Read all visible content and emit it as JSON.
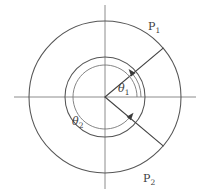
{
  "figure": {
    "type": "geometry-diagram",
    "background_color": "#ffffff"
  },
  "colors": {
    "axis": "#8c8c8c",
    "circle": "#555555",
    "radius": "#444444",
    "arc": "#777777",
    "arrow": "#3a3a3a",
    "label": "#3d3d3d"
  },
  "geometry": {
    "center": {
      "x": 105,
      "y": 97
    },
    "inner_circle": {
      "cx": 105,
      "cy": 97,
      "r": 40
    },
    "outer_circle": {
      "cx": 105,
      "cy": 97,
      "r": 76
    },
    "horizontal_axis": {
      "x1": 14,
      "y1": 97,
      "x2": 196,
      "y2": 97
    },
    "vertical_axis": {
      "x1": 105,
      "y1": 5,
      "x2": 105,
      "y2": 189
    }
  },
  "points": [
    {
      "id": "P1",
      "label": "P",
      "subscript": "1",
      "angle_deg": 40,
      "line": {
        "x1": 105,
        "y1": 97,
        "x2": 163.2,
        "y2": 48.1
      },
      "label_pos": {
        "x": 148,
        "y": 30
      }
    },
    {
      "id": "P2",
      "label": "P",
      "subscript": "2",
      "angle_deg": -40,
      "line": {
        "x1": 105,
        "y1": 97,
        "x2": 163.2,
        "y2": 145.9
      },
      "label_pos": {
        "x": 143,
        "y": 182
      }
    }
  ],
  "angles": [
    {
      "id": "theta1",
      "label": "θ",
      "subscript": "1",
      "symbol": "θ₁",
      "value_deg": 40,
      "direction": "counterclockwise",
      "from_deg": 0,
      "to_deg": 40,
      "arc_radius": 36,
      "label_pos": {
        "x": 118,
        "y": 92
      }
    },
    {
      "id": "theta2",
      "label": "θ",
      "subscript": "2",
      "symbol": "θ₂",
      "value_deg": 320,
      "direction": "counterclockwise",
      "from_deg": 0,
      "to_deg": 320,
      "arc_radius": 32,
      "label_pos": {
        "x": 72,
        "y": 125
      }
    }
  ]
}
